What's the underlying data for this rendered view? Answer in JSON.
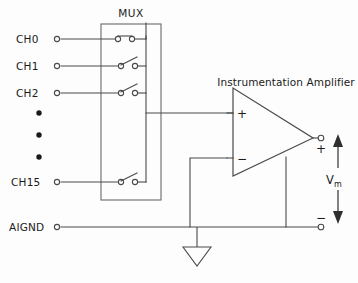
{
  "diagram": {
    "mux_label": "MUX",
    "amplifier_label": "Instrumentation Amplifier",
    "ground_label": "AIGND",
    "measured_voltage_label": "V",
    "measured_voltage_subscript": "m",
    "plus_input_sign": "+",
    "minus_input_sign": "−",
    "output_plus_sign": "+",
    "output_minus_sign": "−",
    "channels": [
      {
        "label": "CH0",
        "state": "closed"
      },
      {
        "label": "CH1",
        "state": "open"
      },
      {
        "label": "CH2",
        "state": "open"
      },
      {
        "label": "CH15",
        "state": "open"
      }
    ],
    "ellipsis_dots": 3,
    "colors": {
      "background": "#fdfdfd",
      "wire": "#4a4a4a",
      "box": "#6a6a6a",
      "text": "#1a1a1a",
      "arrow": "#2f2f2f"
    }
  }
}
